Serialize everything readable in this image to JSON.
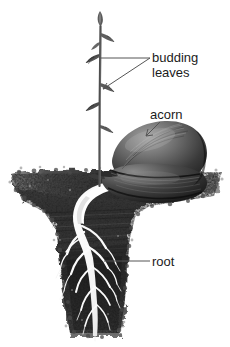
{
  "figure": {
    "background_color": "#ffffff",
    "labels": {
      "budding_leaves_line1": "budding",
      "budding_leaves_line2": "leaves",
      "acorn": "acorn",
      "root": "root"
    },
    "colors": {
      "label_text": "#1b1b1b",
      "leader_line": "#555555",
      "soil_dark": "#2b2b2b",
      "soil_mid": "#585858",
      "soil_light": "#8d8d8d",
      "acorn_dark": "#242424",
      "acorn_mid": "#6d6d6d",
      "acorn_light": "#9a9a9a",
      "root_white": "#fdfdfd",
      "stem": "#4a4a4a"
    },
    "parts": [
      "sprout stem",
      "leaf buds",
      "acorn cotyledons",
      "taproot",
      "soil"
    ]
  }
}
